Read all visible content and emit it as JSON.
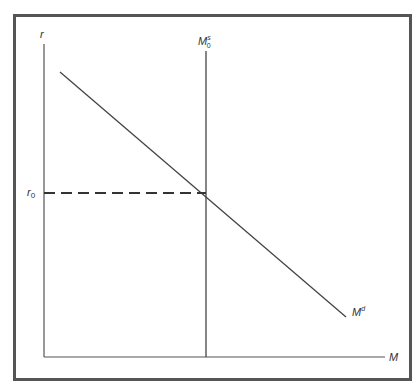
{
  "diagram": {
    "title": "",
    "axes": {
      "y_label": "r",
      "x_label": "M"
    },
    "labels": {
      "interest_rate_level": {
        "base": "r",
        "sub": "0"
      },
      "money_supply": {
        "base": "M",
        "sup": "s",
        "sub": "0"
      },
      "money_demand": {
        "base": "M",
        "sup": "d"
      }
    },
    "curves": [
      {
        "name": "money-demand",
        "type": "line",
        "description": "Downward sloping money demand curve M^d"
      },
      {
        "name": "money-supply",
        "type": "vertical-line",
        "description": "Vertical money supply M_0^s"
      },
      {
        "name": "equilibrium-rate-guide",
        "type": "dashed-horizontal",
        "description": "Dashed line from r_0 to equilibrium"
      }
    ],
    "colors": {
      "line": "#444444",
      "frame": "#555555",
      "background": "#ffffff"
    }
  }
}
